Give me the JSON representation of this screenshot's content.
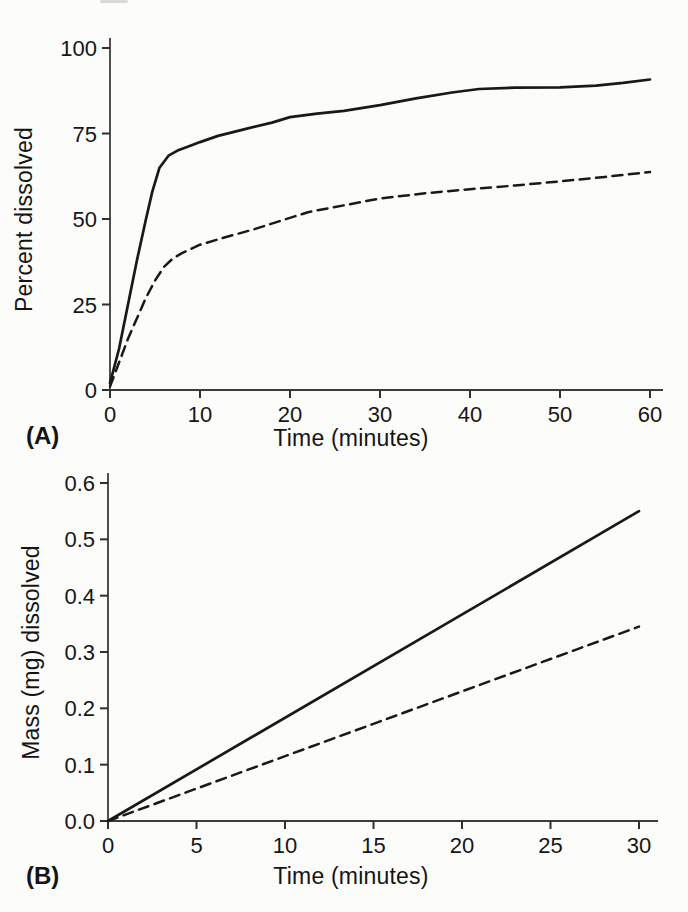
{
  "figure": {
    "panels": [
      {
        "label": "(A)"
      },
      {
        "label": "(B)"
      }
    ],
    "ink_color": "#191919",
    "axis_color": "#3c3c3c",
    "background": "#fcfcfa"
  },
  "chart_data": [
    {
      "type": "line",
      "panel": "(A)",
      "title": "",
      "xlabel": "Time (minutes)",
      "ylabel": "Percent dissolved",
      "xlim": [
        0,
        60
      ],
      "ylim": [
        0,
        100
      ],
      "grid": false,
      "legend": "none",
      "xticks": [
        0,
        10,
        20,
        30,
        40,
        50,
        60
      ],
      "xtick_labels": [
        "0",
        "10",
        "20",
        "30",
        "40",
        "50",
        "60"
      ],
      "yticks": [
        0,
        25,
        50,
        75,
        100
      ],
      "ytick_labels": [
        "0",
        "25",
        "50",
        "75",
        "100"
      ],
      "series": [
        {
          "name": "solid-curve",
          "style": "solid",
          "x": [
            0,
            1,
            2,
            3,
            4,
            4.7,
            5.5,
            6.5,
            7.5,
            9,
            10,
            12,
            15,
            18,
            20,
            23,
            26,
            30,
            34,
            38,
            41,
            45,
            50,
            54,
            57,
            60
          ],
          "y": [
            2,
            12,
            25,
            38,
            50,
            58,
            65,
            68.5,
            70,
            71.5,
            72.5,
            74.3,
            76.3,
            78.2,
            79.8,
            80.8,
            81.6,
            83.3,
            85.3,
            87,
            88,
            88.4,
            88.5,
            89,
            89.8,
            90.8
          ]
        },
        {
          "name": "dashed-curve",
          "style": "dashed",
          "x": [
            0,
            2,
            4,
            5,
            6,
            7,
            8,
            10,
            13,
            16,
            19,
            22,
            25,
            30,
            35,
            40,
            45,
            50,
            55,
            60
          ],
          "y": [
            1,
            15,
            27,
            32,
            36,
            38.5,
            40,
            42.5,
            44.8,
            47,
            49.5,
            52,
            53.5,
            56,
            57.5,
            58.7,
            59.8,
            61,
            62.3,
            63.7
          ]
        }
      ]
    },
    {
      "type": "line",
      "panel": "(B)",
      "title": "",
      "xlabel": "Time (minutes)",
      "ylabel": "Mass (mg) dissolved",
      "xlim": [
        0,
        30
      ],
      "ylim": [
        0,
        0.6
      ],
      "grid": false,
      "legend": "none",
      "xticks": [
        0,
        5,
        10,
        15,
        20,
        25,
        30
      ],
      "xtick_labels": [
        "0",
        "5",
        "10",
        "15",
        "20",
        "25",
        "30"
      ],
      "yticks": [
        0,
        0.1,
        0.2,
        0.3,
        0.4,
        0.5,
        0.6
      ],
      "ytick_labels": [
        "0.0",
        "0.1",
        "0.2",
        "0.3",
        "0.4",
        "0.5",
        "0.6"
      ],
      "series": [
        {
          "name": "solid-line",
          "style": "solid",
          "x": [
            0,
            30
          ],
          "y": [
            0,
            0.55
          ]
        },
        {
          "name": "dashed-line",
          "style": "dashed",
          "x": [
            0,
            30
          ],
          "y": [
            0,
            0.345
          ]
        }
      ]
    }
  ]
}
